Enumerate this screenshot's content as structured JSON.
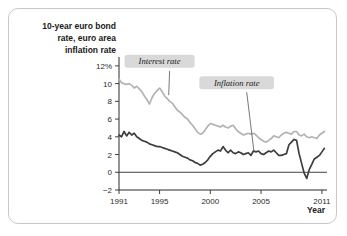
{
  "figure": {
    "y_axis_title": "10-year euro bond rate, euro area inflation rate",
    "y_axis_title_line1": "10-year euro bond",
    "y_axis_title_line2": "rate, euro area",
    "y_axis_title_line3": "inflation rate",
    "x_axis_name": "Year"
  },
  "chart_data": {
    "type": "line",
    "title": "",
    "xlabel": "Year",
    "ylabel": "10-year euro bond rate, euro area inflation rate",
    "xlim": [
      1991,
      2011.5
    ],
    "ylim": [
      -2,
      13
    ],
    "xticks": [
      1991,
      1995,
      2000,
      2005,
      2011
    ],
    "xtick_labels": [
      "1991",
      "1995",
      "2000",
      "2005",
      "2011"
    ],
    "yticks": [
      -2,
      0,
      2,
      4,
      6,
      8,
      10,
      12
    ],
    "ytick_labels": [
      "−2",
      "0",
      "2",
      "4",
      "6",
      "8",
      "10",
      "12%"
    ],
    "grid": false,
    "legend_position": "inline-annotations",
    "zero_line": 0,
    "colors": {
      "interest_rate": "#b3b3b3",
      "inflation_rate": "#3d3d3d",
      "label_box": "#d9d9d9",
      "axis": "#2b2b2b",
      "border": "#c8c8c8",
      "background": "#ffffff"
    },
    "annotations": [
      {
        "text": "Interest rate",
        "x": 1995.0,
        "y": 12.0,
        "points_to_x": 1995.9,
        "points_to_y": 8.7
      },
      {
        "text": "Inflation rate",
        "x": 2002.6,
        "y": 9.6,
        "points_to_x": 2004.3,
        "points_to_y": 2.35
      }
    ],
    "series": [
      {
        "name": "Interest rate",
        "color": "#b3b3b3",
        "x": [
          1991.0,
          1991.25,
          1991.5,
          1991.75,
          1992.0,
          1992.25,
          1992.5,
          1992.75,
          1993.0,
          1993.25,
          1993.5,
          1993.75,
          1994.0,
          1994.25,
          1994.5,
          1994.75,
          1995.0,
          1995.25,
          1995.5,
          1995.75,
          1996.0,
          1996.25,
          1996.5,
          1996.75,
          1997.0,
          1997.25,
          1997.5,
          1997.75,
          1998.0,
          1998.25,
          1998.5,
          1998.75,
          1999.0,
          1999.25,
          1999.5,
          1999.75,
          2000.0,
          2000.25,
          2000.5,
          2000.75,
          2001.0,
          2001.25,
          2001.5,
          2001.75,
          2002.0,
          2002.25,
          2002.5,
          2002.75,
          2003.0,
          2003.25,
          2003.5,
          2003.75,
          2004.0,
          2004.25,
          2004.5,
          2004.75,
          2005.0,
          2005.25,
          2005.5,
          2005.75,
          2006.0,
          2006.25,
          2006.5,
          2006.75,
          2007.0,
          2007.25,
          2007.5,
          2007.75,
          2008.0,
          2008.25,
          2008.5,
          2008.75,
          2009.0,
          2009.25,
          2009.5,
          2009.75,
          2010.0,
          2010.25,
          2010.5,
          2010.75,
          2011.0,
          2011.25
        ],
        "values": [
          10.5,
          10.1,
          10.0,
          9.9,
          10.0,
          9.8,
          9.5,
          9.7,
          9.4,
          9.1,
          8.6,
          8.2,
          7.7,
          8.4,
          8.9,
          9.2,
          9.5,
          9.1,
          8.6,
          8.3,
          8.0,
          7.8,
          7.4,
          7.0,
          6.8,
          6.5,
          6.2,
          6.0,
          5.6,
          5.3,
          4.9,
          4.5,
          4.3,
          4.4,
          4.8,
          5.2,
          5.5,
          5.4,
          5.3,
          5.2,
          5.1,
          5.3,
          5.1,
          5.0,
          5.2,
          5.3,
          4.9,
          4.6,
          4.4,
          4.2,
          4.3,
          4.4,
          4.3,
          4.4,
          4.2,
          3.9,
          3.7,
          3.5,
          3.4,
          3.6,
          3.8,
          4.1,
          4.0,
          3.9,
          4.2,
          4.4,
          4.5,
          4.4,
          4.3,
          4.6,
          4.6,
          4.2,
          4.1,
          4.3,
          4.0,
          3.9,
          4.0,
          3.9,
          3.8,
          4.2,
          4.4,
          4.6
        ]
      },
      {
        "name": "Inflation rate",
        "color": "#3d3d3d",
        "x": [
          1991.0,
          1991.25,
          1991.5,
          1991.75,
          1992.0,
          1992.25,
          1992.5,
          1992.75,
          1993.0,
          1993.25,
          1993.5,
          1993.75,
          1994.0,
          1994.25,
          1994.5,
          1994.75,
          1995.0,
          1995.25,
          1995.5,
          1995.75,
          1996.0,
          1996.25,
          1996.5,
          1996.75,
          1997.0,
          1997.25,
          1997.5,
          1997.75,
          1998.0,
          1998.25,
          1998.5,
          1998.75,
          1999.0,
          1999.25,
          1999.5,
          1999.75,
          2000.0,
          2000.25,
          2000.5,
          2000.75,
          2001.0,
          2001.25,
          2001.5,
          2001.75,
          2002.0,
          2002.25,
          2002.5,
          2002.75,
          2003.0,
          2003.25,
          2003.5,
          2003.75,
          2004.0,
          2004.25,
          2004.5,
          2004.75,
          2005.0,
          2005.25,
          2005.5,
          2005.75,
          2006.0,
          2006.25,
          2006.5,
          2006.75,
          2007.0,
          2007.25,
          2007.5,
          2007.75,
          2008.0,
          2008.25,
          2008.5,
          2008.75,
          2009.0,
          2009.25,
          2009.5,
          2009.75,
          2010.0,
          2010.25,
          2010.5,
          2010.75,
          2011.0,
          2011.25
        ],
        "values": [
          4.2,
          4.0,
          4.6,
          4.1,
          4.5,
          4.2,
          4.4,
          4.0,
          3.8,
          3.6,
          3.5,
          3.4,
          3.2,
          3.1,
          3.0,
          2.9,
          2.9,
          2.8,
          2.7,
          2.6,
          2.5,
          2.4,
          2.3,
          2.2,
          2.0,
          1.8,
          1.7,
          1.6,
          1.4,
          1.3,
          1.1,
          1.0,
          0.8,
          0.9,
          1.1,
          1.4,
          1.8,
          2.1,
          2.3,
          2.5,
          2.4,
          2.9,
          2.5,
          2.2,
          2.5,
          2.2,
          2.1,
          2.3,
          2.2,
          2.0,
          2.1,
          2.2,
          1.9,
          2.4,
          2.3,
          2.4,
          2.1,
          2.0,
          2.2,
          2.4,
          2.3,
          2.5,
          2.2,
          1.9,
          1.9,
          2.0,
          2.1,
          3.1,
          3.4,
          3.7,
          3.6,
          2.1,
          1.0,
          -0.1,
          -0.7,
          0.3,
          0.9,
          1.5,
          1.7,
          1.9,
          2.3,
          2.7
        ]
      }
    ]
  }
}
